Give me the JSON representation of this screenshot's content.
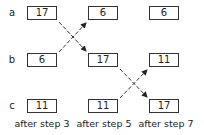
{
  "diagram": {
    "row_labels": [
      "a",
      "b",
      "c"
    ],
    "columns": [
      {
        "caption": "after step 3",
        "values": {
          "a": "17",
          "b": "6",
          "c": "11"
        }
      },
      {
        "caption": "after step 5",
        "values": {
          "a": "6",
          "b": "17",
          "c": "11"
        }
      },
      {
        "caption": "after step 7",
        "values": {
          "a": "6",
          "b": "11",
          "c": "17"
        }
      }
    ],
    "swaps": [
      {
        "between": "after step 3 -> after step 5",
        "rows": [
          "a",
          "b"
        ]
      },
      {
        "between": "after step 5 -> after step 7",
        "rows": [
          "b",
          "c"
        ]
      }
    ]
  }
}
